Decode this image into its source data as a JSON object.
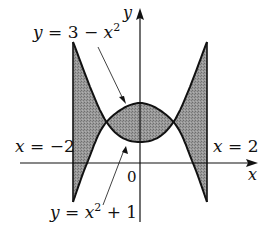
{
  "figure": {
    "type": "region-between-curves",
    "axes": {
      "x_label": "x",
      "y_label": "y",
      "origin_label": "0",
      "origin_px": [
        140,
        163
      ],
      "x_scale_px_per_unit": 33.5
    },
    "curves": [
      {
        "id": "upper",
        "label": "y = 3 − x²",
        "label_parts": {
          "lhs": "y",
          "eq": " = 3 − ",
          "var": "x",
          "sup": "2",
          "tail": ""
        },
        "equation": "y = 3 - x^2",
        "key_points_px": [
          [
            -2,
            202
          ],
          [
            -1.58,
            163
          ],
          [
            -1,
            122
          ],
          [
            0,
            103
          ],
          [
            1,
            122
          ],
          [
            1.58,
            163
          ],
          [
            2,
            202
          ]
        ]
      },
      {
        "id": "lower",
        "label": "y = x² + 1",
        "label_parts": {
          "lhs": "y",
          "eq": " = ",
          "var": "x",
          "sup": "2",
          "tail": " + 1"
        },
        "equation": "y = x^2 + 1",
        "key_points_px": [
          [
            -2,
            42
          ],
          [
            -1,
            122
          ],
          [
            0,
            142
          ],
          [
            1,
            122
          ],
          [
            2,
            42
          ]
        ]
      }
    ],
    "bounds": [
      {
        "id": "left",
        "label_lhs": "x",
        "label_rhs": " = −2",
        "x": -2
      },
      {
        "id": "right",
        "label_lhs": "x",
        "label_rhs": " = 2",
        "x": 2
      }
    ],
    "shading": {
      "color": "#8a8a8a",
      "description": "region between the two curves from x = -2 to x = 2"
    },
    "intersections": [
      [
        -1,
        2
      ],
      [
        1,
        2
      ]
    ],
    "colors": {
      "stroke": "#111111",
      "fill": "#8a8a8a",
      "background": "#ffffff"
    }
  }
}
